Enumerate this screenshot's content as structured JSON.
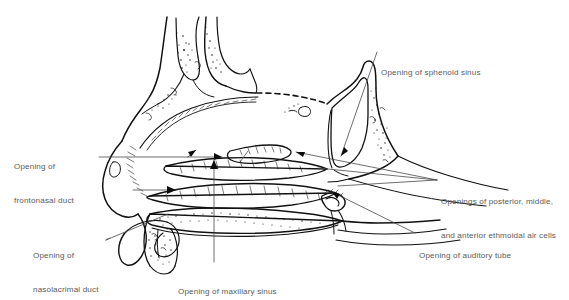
{
  "figure": {
    "name": "lateral-wall-of-nasal-cavity",
    "background_color": "#ffffff",
    "ink_color": "#111111",
    "label_color": "#5a5a5a",
    "leader_color": "#4a4a4a"
  },
  "labels": {
    "sphenoid_sinus": {
      "text": "Opening of sphenoid sinus",
      "lines": [
        "Opening of sphenoid sinus"
      ],
      "x": 381,
      "y": 51,
      "align": "left"
    },
    "frontonasal_duct": {
      "text": "Opening of frontonasal duct",
      "lines": [
        "Opening of",
        "frontonasal duct"
      ],
      "x": 14,
      "y": 138,
      "align": "left"
    },
    "ethmoidal_air_cells": {
      "text": "Openings of posterior, middle, and anterior ethmoidal air cells",
      "lines": [
        "Openings of posterior, middle,",
        "and anterior ethmoidal air cells"
      ],
      "x": 440,
      "y": 177,
      "align": "left"
    },
    "auditory_tube": {
      "text": "Opening of auditory tube",
      "lines": [
        "Opening of auditory tube"
      ],
      "x": 418,
      "y": 230,
      "align": "left"
    },
    "nasolacrimal_duct": {
      "text": "Opening of nasolacrimal duct",
      "lines": [
        "Opening of",
        "nasolacrimal duct"
      ],
      "x": 33,
      "y": 228,
      "align": "left"
    },
    "maxillary_sinus": {
      "text": "Opening of maxillary sinus",
      "lines": [
        "Opening of maxillary sinus"
      ],
      "x": 178,
      "y": 266,
      "align": "left"
    }
  },
  "structures": [
    {
      "name": "frontal-bone",
      "note": "Frontal bone with frontal sinus and stippled diploe, upper left of drawing"
    },
    {
      "name": "frontal-sinus-cavity",
      "note": "Air cavity inside the frontal bone"
    },
    {
      "name": "cribriform-plate",
      "note": "Dashed line marking the roof of the nasal cavity"
    },
    {
      "name": "sphenoid-bone",
      "note": "Sphenoid body with sphenoidal sinus cavity, right of drawing"
    },
    {
      "name": "sphenoid-sinus-cavity",
      "note": "Large air cavity in the sphenoid body"
    },
    {
      "name": "superior-concha",
      "note": "Uppermost cut turbinate"
    },
    {
      "name": "middle-concha",
      "note": "Middle cut turbinate"
    },
    {
      "name": "inferior-concha",
      "note": "Lowest cut turbinate"
    },
    {
      "name": "nasal-vestibule",
      "note": "Anterior nostril region at lower left"
    },
    {
      "name": "hard-palate",
      "note": "Stippled bony palate below the nasal floor"
    },
    {
      "name": "soft-palate",
      "note": "Posterior continuation of the palate"
    },
    {
      "name": "torus-tubarius",
      "note": "Elevation around the auditory tube opening"
    },
    {
      "name": "nasopharynx",
      "note": "Posterior airway behind the conchae"
    }
  ],
  "top_artifact": {
    "text": "",
    "visible": true
  }
}
